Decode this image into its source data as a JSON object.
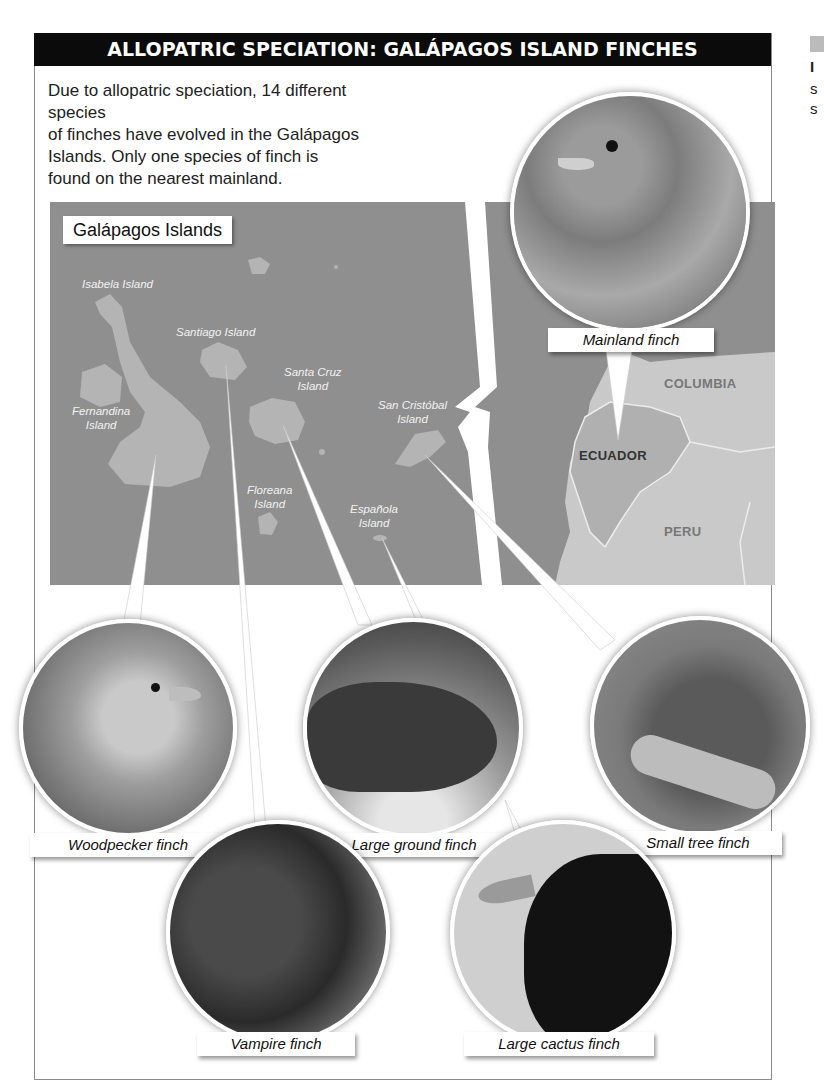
{
  "figure": {
    "title": "ALLOPATRIC SPECIATION: GALÁPAGOS ISLAND FINCHES",
    "intro_lines": [
      "Due to allopatric speciation, 14 different species",
      "of finches have evolved in the Galápagos",
      "Islands. Only one species of finch is",
      "found on the nearest mainland."
    ]
  },
  "map": {
    "title": "Galápagos Islands",
    "islands": [
      {
        "name": "Isabela Island",
        "lines": [
          "Isabela Island"
        ]
      },
      {
        "name": "Santiago Island",
        "lines": [
          "Santiago Island"
        ]
      },
      {
        "name": "Santa Cruz Island",
        "lines": [
          "Santa Cruz",
          "Island"
        ]
      },
      {
        "name": "Fernandina Island",
        "lines": [
          "Fernandina",
          "Island"
        ]
      },
      {
        "name": "San Cristóbal Island",
        "lines": [
          "San Cristóbal",
          "Island"
        ]
      },
      {
        "name": "Floreana Island",
        "lines": [
          "Floreana",
          "Island"
        ]
      },
      {
        "name": "Española Island",
        "lines": [
          "Española",
          "Island"
        ]
      }
    ],
    "countries": [
      "COLUMBIA",
      "ECUADOR",
      "PERU"
    ],
    "colors": {
      "ocean": "#8f8f8f",
      "galapagos_land": "#b4b4b4",
      "mainland": "#c9c9c9",
      "ecuador": "#b0b0b0"
    }
  },
  "finches": [
    {
      "label": "Mainland finch",
      "location": "Ecuador"
    },
    {
      "label": "Woodpecker finch",
      "location": "Isabela Island"
    },
    {
      "label": "Large ground finch",
      "location": "Santa Cruz Island"
    },
    {
      "label": "Small tree finch",
      "location": "San Cristóbal Island"
    },
    {
      "label": "Vampire finch",
      "location": "Santiago Island"
    },
    {
      "label": "Large cactus finch",
      "location": "Española Island"
    }
  ],
  "side_fragment": {
    "letters": [
      "I",
      "s",
      "s"
    ]
  }
}
